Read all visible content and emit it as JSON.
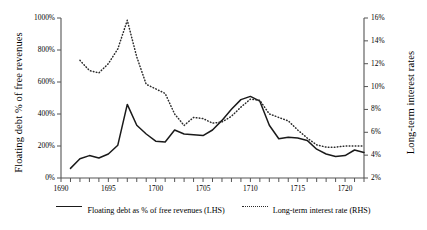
{
  "chart_data": {
    "type": "line",
    "title": "",
    "xlabel": "",
    "ylabel": "Floating debt % of free revenues",
    "y2label": "Long-term interest rates",
    "xlim": [
      1690,
      1722
    ],
    "ylim": [
      0,
      1000
    ],
    "y2lim": [
      2,
      16
    ],
    "grid": false,
    "legend_position": "bottom-center",
    "x_ticks_major": [
      1690,
      1695,
      1700,
      1705,
      1710,
      1715,
      1720
    ],
    "x_tick_labels": [
      "1690",
      "1695",
      "1700",
      "1705",
      "1710",
      "1715",
      "1720"
    ],
    "x_ticks_minor_step": 1,
    "y_ticks": [
      0,
      200,
      400,
      600,
      800,
      1000
    ],
    "y_tick_labels": [
      "0%",
      "200%",
      "400%",
      "600%",
      "800%",
      "1000%"
    ],
    "y2_ticks": [
      2,
      4,
      6,
      8,
      10,
      12,
      14,
      16
    ],
    "y2_tick_labels": [
      "2%",
      "4%",
      "6%",
      "8%",
      "10%",
      "12%",
      "14%",
      "16%"
    ],
    "series": [
      {
        "name": "Floating debt as % of free revenues (LHS)",
        "axis": "left",
        "style": "solid",
        "color": "#1a1a1a",
        "x": [
          1691,
          1692,
          1693,
          1694,
          1695,
          1696,
          1697,
          1698,
          1699,
          1700,
          1701,
          1702,
          1703,
          1704,
          1705,
          1706,
          1707,
          1708,
          1709,
          1710,
          1711,
          1712,
          1713,
          1714,
          1715,
          1716,
          1717,
          1718,
          1719,
          1720,
          1721,
          1722
        ],
        "values": [
          60,
          120,
          140,
          125,
          150,
          205,
          460,
          330,
          275,
          230,
          225,
          300,
          275,
          270,
          265,
          300,
          360,
          430,
          490,
          510,
          480,
          330,
          245,
          255,
          250,
          235,
          180,
          150,
          135,
          140,
          175,
          160
        ]
      },
      {
        "name": "Long-term interest rate (RHS)",
        "axis": "right",
        "style": "dotted",
        "color": "#2b2b2b",
        "x": [
          1692,
          1693,
          1694,
          1695,
          1696,
          1697,
          1698,
          1699,
          1700,
          1701,
          1702,
          1703,
          1704,
          1705,
          1706,
          1707,
          1708,
          1709,
          1710,
          1711,
          1712,
          1713,
          1714,
          1715,
          1716,
          1717,
          1718,
          1719,
          1720,
          1721,
          1722
        ],
        "values": [
          12.3,
          11.4,
          11.2,
          12.0,
          13.3,
          15.8,
          12.6,
          10.2,
          9.8,
          9.4,
          7.6,
          6.6,
          7.3,
          7.2,
          6.8,
          6.9,
          7.4,
          8.2,
          8.9,
          8.8,
          7.6,
          7.3,
          7.0,
          6.2,
          5.5,
          4.9,
          4.7,
          4.7,
          4.8,
          4.8,
          4.8
        ]
      }
    ]
  },
  "legend": {
    "entries": [
      {
        "label": "Floating debt as % of free revenues (LHS)",
        "style": "solid"
      },
      {
        "label": "Long-term interest rate (RHS)",
        "style": "dotted"
      }
    ]
  }
}
